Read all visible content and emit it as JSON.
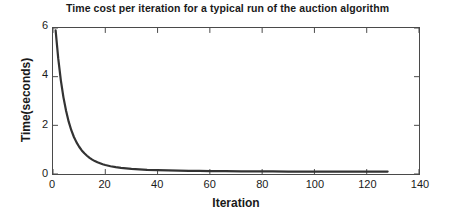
{
  "chart_data": {
    "type": "line",
    "title": "Time cost per iteration for a typical run of the auction algorithm",
    "xlabel": "Iteration",
    "ylabel": "Time(seconds)",
    "xlim": [
      0,
      140
    ],
    "ylim": [
      0,
      6
    ],
    "xticks": [
      0,
      20,
      40,
      60,
      80,
      100,
      120,
      140
    ],
    "yticks": [
      0,
      2,
      4,
      6
    ],
    "grid": false,
    "legend": null,
    "line_color": "#333333",
    "line_width": 2,
    "series": [
      {
        "name": "time per iteration",
        "x": [
          1,
          2,
          3,
          4,
          5,
          6,
          7,
          8,
          9,
          10,
          11,
          12,
          13,
          14,
          15,
          16,
          17,
          18,
          19,
          20,
          22,
          24,
          26,
          28,
          30,
          33,
          36,
          40,
          44,
          48,
          52,
          56,
          60,
          66,
          72,
          78,
          84,
          90,
          96,
          104,
          112,
          120,
          128
        ],
        "values": [
          5.9,
          4.75,
          3.85,
          3.15,
          2.6,
          2.15,
          1.8,
          1.52,
          1.3,
          1.12,
          0.97,
          0.85,
          0.75,
          0.66,
          0.59,
          0.53,
          0.48,
          0.44,
          0.4,
          0.37,
          0.32,
          0.28,
          0.25,
          0.23,
          0.21,
          0.19,
          0.17,
          0.16,
          0.15,
          0.14,
          0.13,
          0.13,
          0.12,
          0.12,
          0.11,
          0.11,
          0.11,
          0.1,
          0.1,
          0.1,
          0.1,
          0.1,
          0.1
        ]
      }
    ]
  },
  "axis": {
    "xtick_labels": [
      "0",
      "20",
      "40",
      "60",
      "80",
      "100",
      "120",
      "140"
    ],
    "ytick_labels": [
      "0",
      "2",
      "4",
      "6"
    ]
  }
}
